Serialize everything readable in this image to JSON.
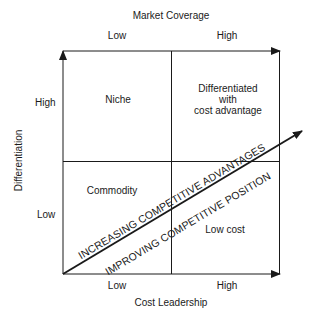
{
  "diagram": {
    "top_axis": {
      "title": "Market Coverage",
      "low": "Low",
      "high": "High"
    },
    "bottom_axis": {
      "title": "Cost Leadership",
      "low": "Low",
      "high": "High"
    },
    "left_axis": {
      "title": "Differentiation",
      "high": "High",
      "low": "Low"
    },
    "quadrants": {
      "top_left": "Niche",
      "top_right_line1": "Differentiated",
      "top_right_line2": "with",
      "top_right_line3": "cost advantage",
      "bottom_left": "Commodity",
      "bottom_right": "Low cost"
    },
    "diagonal": {
      "upper_text": "INCREASING COMPETITIVE ADVANTAGES",
      "lower_text": "IMPROVING COMPETITIVE POSITION"
    },
    "colors": {
      "line": "#1a1a1a",
      "background": "#ffffff"
    }
  }
}
